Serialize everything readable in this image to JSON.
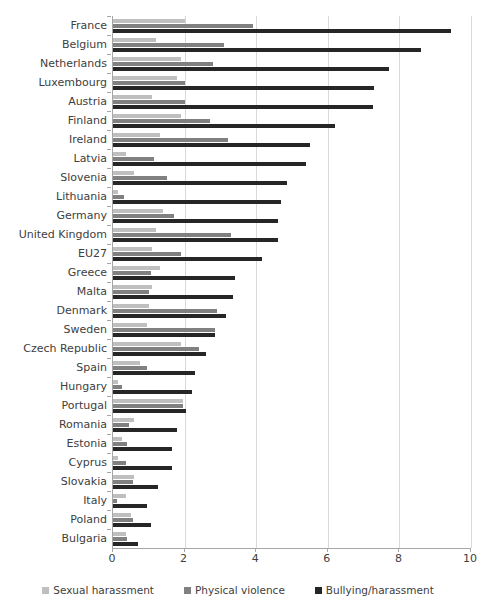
{
  "chart_data": {
    "type": "bar",
    "orientation": "horizontal",
    "title": "",
    "subtitle": "",
    "xlabel": "",
    "ylabel": "",
    "xlim": [
      0,
      10
    ],
    "xticks": [
      "0",
      "2",
      "4",
      "6",
      "8",
      "10"
    ],
    "xtick_values": [
      0,
      2,
      4,
      6,
      8,
      10
    ],
    "grid": true,
    "grid_axis": "x",
    "legend_position": "bottom",
    "categories": [
      "France",
      "Belgium",
      "Netherlands",
      "Luxembourg",
      "Austria",
      "Finland",
      "Ireland",
      "Latvia",
      "Slovenia",
      "Lithuania",
      "Germany",
      "United Kingdom",
      "EU27",
      "Greece",
      "Malta",
      "Denmark",
      "Sweden",
      "Czech Republic",
      "Spain",
      "Hungary",
      "Portugal",
      "Romania",
      "Estonia",
      "Cyprus",
      "Slovakia",
      "Italy",
      "Poland",
      "Bulgaria"
    ],
    "series": [
      {
        "name": "Sexual harassment",
        "color": "#bfbfbf",
        "values": [
          2.0,
          1.2,
          1.9,
          1.8,
          1.1,
          1.9,
          1.3,
          0.35,
          0.6,
          0.15,
          1.4,
          1.2,
          1.1,
          1.3,
          1.1,
          1.0,
          0.95,
          1.9,
          0.75,
          0.15,
          1.95,
          0.6,
          0.25,
          0.15,
          0.6,
          0.35,
          0.5,
          0.35
        ]
      },
      {
        "name": "Physical violence",
        "color": "#808080",
        "values": [
          3.9,
          3.1,
          2.8,
          2.0,
          2.0,
          2.7,
          3.2,
          1.15,
          1.5,
          0.3,
          1.7,
          3.3,
          1.9,
          1.05,
          1.0,
          2.9,
          2.85,
          2.4,
          0.95,
          0.25,
          1.95,
          0.45,
          0.4,
          0.35,
          0.55,
          0.1,
          0.55,
          0.4
        ]
      },
      {
        "name": "Bullying/harassment",
        "color": "#262626",
        "values": [
          9.45,
          8.6,
          7.7,
          7.3,
          7.25,
          6.2,
          5.5,
          5.4,
          4.85,
          4.7,
          4.6,
          4.6,
          4.15,
          3.4,
          3.35,
          3.15,
          2.85,
          2.6,
          2.3,
          2.2,
          2.05,
          1.8,
          1.65,
          1.65,
          1.25,
          0.95,
          1.05,
          0.7
        ]
      }
    ]
  },
  "legend": {
    "items": [
      {
        "label": "Sexual harassment",
        "color": "#bfbfbf"
      },
      {
        "label": "Physical violence",
        "color": "#808080"
      },
      {
        "label": "Bullying/harassment",
        "color": "#262626"
      }
    ]
  }
}
